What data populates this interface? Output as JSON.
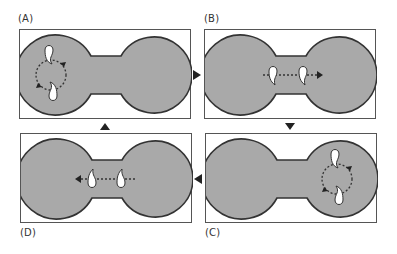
{
  "figure": {
    "colors": {
      "chamber_fill": "#a9a9a9",
      "chamber_stroke": "#333333",
      "droplet": "#ffffff",
      "frame": "#555555",
      "arrow": "#222222"
    },
    "panels": [
      {
        "id": "A",
        "label": "(A)",
        "state": "rotation-left-lobe"
      },
      {
        "id": "B",
        "label": "(B)",
        "state": "translation-right"
      },
      {
        "id": "C",
        "label": "(C)",
        "state": "rotation-right-lobe"
      },
      {
        "id": "D",
        "label": "(D)",
        "state": "translation-left"
      }
    ],
    "transitions": [
      {
        "from": "A",
        "to": "B",
        "direction": "right"
      },
      {
        "from": "B",
        "to": "C",
        "direction": "down"
      },
      {
        "from": "C",
        "to": "D",
        "direction": "left"
      },
      {
        "from": "D",
        "to": "A",
        "direction": "up"
      }
    ]
  }
}
